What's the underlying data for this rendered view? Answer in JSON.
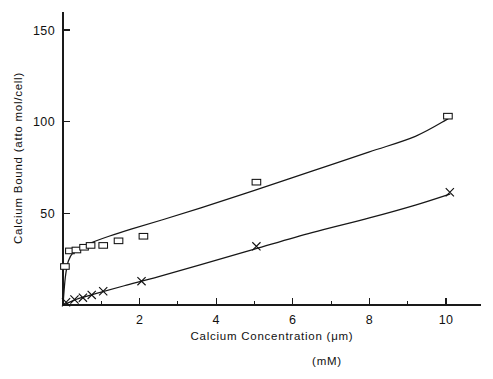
{
  "chart_data": {
    "type": "scatter",
    "title": "",
    "subtitle": "",
    "xlabel": "Calcium Concentration  (μm)",
    "xlabel_secondary": "(mM)",
    "ylabel": "Calcium Bound  (atto mol/cell)",
    "xlim": [
      0,
      11.4
    ],
    "ylim": [
      0,
      163
    ],
    "grid": false,
    "legend": "none",
    "x_ticks_major": [
      2,
      4,
      6,
      8,
      10
    ],
    "x_ticks_minor": [
      1,
      3,
      5,
      7,
      9,
      11
    ],
    "x_tick_labels": [
      "2",
      "4",
      "6",
      "8",
      "10"
    ],
    "y_ticks_major": [
      50,
      100,
      150
    ],
    "y_tick_labels": [
      "50",
      "100",
      "150"
    ],
    "series": [
      {
        "name": "Calcium bound (square markers)",
        "marker": "open-square",
        "points": [
          {
            "x": 0.05,
            "y": 21.0
          },
          {
            "x": 0.18,
            "y": 29.5
          },
          {
            "x": 0.35,
            "y": 30.0
          },
          {
            "x": 0.55,
            "y": 31.5
          },
          {
            "x": 0.72,
            "y": 32.5
          },
          {
            "x": 1.05,
            "y": 32.5
          },
          {
            "x": 1.45,
            "y": 35.0
          },
          {
            "x": 2.1,
            "y": 37.5
          },
          {
            "x": 5.05,
            "y": 67.0
          },
          {
            "x": 10.05,
            "y": 103.0
          }
        ],
        "fit_curve": [
          {
            "x": 0.0,
            "y": 0.0
          },
          {
            "x": 0.06,
            "y": 15.0
          },
          {
            "x": 0.14,
            "y": 24.0
          },
          {
            "x": 0.28,
            "y": 29.0
          },
          {
            "x": 0.5,
            "y": 32.0
          },
          {
            "x": 0.8,
            "y": 34.5
          },
          {
            "x": 1.2,
            "y": 37.5
          },
          {
            "x": 1.8,
            "y": 41.5
          },
          {
            "x": 2.6,
            "y": 46.5
          },
          {
            "x": 3.6,
            "y": 53.0
          },
          {
            "x": 5.0,
            "y": 62.5
          },
          {
            "x": 6.5,
            "y": 73.0
          },
          {
            "x": 8.0,
            "y": 83.5
          },
          {
            "x": 9.2,
            "y": 92.0
          },
          {
            "x": 10.05,
            "y": 101.5
          }
        ]
      },
      {
        "name": "Calcium bound (x markers)",
        "marker": "cross-x",
        "points": [
          {
            "x": 0.08,
            "y": 1.5
          },
          {
            "x": 0.3,
            "y": 3.0
          },
          {
            "x": 0.52,
            "y": 4.0
          },
          {
            "x": 0.75,
            "y": 5.5
          },
          {
            "x": 1.05,
            "y": 7.5
          },
          {
            "x": 2.05,
            "y": 13.0
          },
          {
            "x": 5.05,
            "y": 32.0
          },
          {
            "x": 10.1,
            "y": 61.5
          }
        ],
        "fit_curve": [
          {
            "x": 0.0,
            "y": 0.0
          },
          {
            "x": 0.4,
            "y": 3.5
          },
          {
            "x": 0.9,
            "y": 6.5
          },
          {
            "x": 1.6,
            "y": 10.5
          },
          {
            "x": 2.5,
            "y": 15.5
          },
          {
            "x": 3.6,
            "y": 22.0
          },
          {
            "x": 5.0,
            "y": 30.5
          },
          {
            "x": 6.5,
            "y": 39.5
          },
          {
            "x": 8.0,
            "y": 47.5
          },
          {
            "x": 9.2,
            "y": 54.5
          },
          {
            "x": 10.1,
            "y": 60.5
          }
        ]
      }
    ]
  },
  "colors": {
    "background": "#ffffff",
    "ink": "#111111",
    "curve": "#171717"
  }
}
